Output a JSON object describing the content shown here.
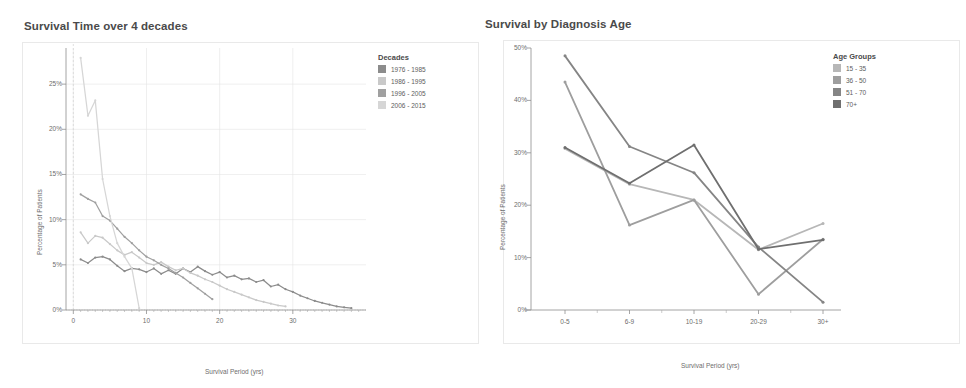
{
  "page": {
    "background": "#ffffff",
    "panel_border_color": "#e9e9e9"
  },
  "charts": {
    "left": {
      "title": "Survival Time over 4 decades",
      "legend_title": "Decades",
      "xlabel": "Survival Period (yrs)",
      "ylabel": "Percentage of Patients"
    },
    "right": {
      "title": "Survival by Diagnosis Age",
      "legend_title": "Age Groups",
      "xlabel": "Survival Period (yrs)",
      "ylabel": "Percentage of Patients"
    }
  },
  "chart_data": [
    {
      "id": "survival-time-over-4-decades",
      "type": "line",
      "title": "Survival Time over 4 decades",
      "xlabel": "Survival Period (yrs)",
      "ylabel": "Percentage of Patients",
      "legend_title": "Decades",
      "legend_position": "right",
      "grid": true,
      "xlim": [
        -1,
        40
      ],
      "ylim": [
        0,
        29
      ],
      "xticks": [
        0,
        10,
        20,
        30
      ],
      "xtick_labels": [
        "0",
        "10",
        "20",
        "30"
      ],
      "yticks": [
        0,
        5,
        10,
        15,
        20,
        25
      ],
      "ytick_labels": [
        "0%",
        "5%",
        "10%",
        "15%",
        "20%",
        "25%"
      ],
      "series": [
        {
          "name": "1976 - 1985",
          "color": "#8c8c8c",
          "x": [
            1,
            2,
            3,
            4,
            5,
            6,
            7,
            8,
            9,
            10,
            11,
            12,
            13,
            14,
            15,
            16,
            17,
            18,
            19,
            20,
            21,
            22,
            23,
            24,
            25,
            26,
            27,
            28,
            29,
            30,
            31,
            32,
            33,
            34,
            35,
            36,
            37,
            38
          ],
          "values": [
            5.6,
            5.2,
            5.8,
            5.9,
            5.6,
            4.9,
            4.3,
            4.6,
            4.5,
            4.2,
            4.6,
            4.0,
            4.4,
            4.0,
            4.6,
            4.2,
            4.8,
            4.3,
            3.9,
            4.2,
            3.6,
            3.8,
            3.4,
            3.5,
            3.1,
            3.3,
            2.6,
            2.8,
            2.3,
            2.0,
            1.6,
            1.3,
            1.0,
            0.8,
            0.6,
            0.4,
            0.3,
            0.2
          ]
        },
        {
          "name": "1986 - 1995",
          "color": "#c9c9c9",
          "x": [
            1,
            2,
            3,
            4,
            5,
            6,
            7,
            8,
            9,
            10,
            11,
            12,
            13,
            14,
            15,
            16,
            17,
            18,
            19,
            20,
            21,
            22,
            23,
            24,
            25,
            26,
            27,
            28,
            29
          ],
          "values": [
            8.6,
            7.4,
            8.2,
            8.0,
            7.3,
            6.6,
            6.1,
            6.4,
            5.8,
            5.2,
            5.0,
            5.3,
            4.8,
            4.4,
            4.6,
            4.1,
            3.8,
            3.4,
            3.1,
            2.7,
            2.3,
            2.0,
            1.7,
            1.4,
            1.1,
            0.9,
            0.7,
            0.5,
            0.4
          ]
        },
        {
          "name": "1996 - 2005",
          "color": "#a0a0a0",
          "x": [
            1,
            2,
            3,
            4,
            5,
            6,
            7,
            8,
            9,
            10,
            11,
            12,
            13,
            14,
            15,
            16,
            17,
            18,
            19
          ],
          "values": [
            12.8,
            12.3,
            11.9,
            10.4,
            9.9,
            9.0,
            8.1,
            7.4,
            6.6,
            5.9,
            5.5,
            5.0,
            4.6,
            4.1,
            3.6,
            3.0,
            2.4,
            1.8,
            1.2
          ]
        },
        {
          "name": "2006 - 2015",
          "color": "#d6d6d6",
          "x": [
            1,
            2,
            3,
            4,
            5,
            6,
            7,
            8,
            9
          ],
          "values": [
            27.9,
            21.5,
            23.2,
            14.5,
            10.4,
            7.4,
            5.9,
            4.6,
            0.2
          ]
        }
      ]
    },
    {
      "id": "survival-by-diagnosis-age",
      "type": "line",
      "title": "Survival by Diagnosis Age",
      "xlabel": "Survival Period (yrs)",
      "ylabel": "Percentage of Patients",
      "legend_title": "Age Groups",
      "legend_position": "right",
      "grid": false,
      "categories": [
        "0-5",
        "6-9",
        "10-19",
        "20-29",
        "30+"
      ],
      "ylim": [
        0,
        50
      ],
      "yticks": [
        0,
        10,
        20,
        30,
        40,
        50
      ],
      "ytick_labels": [
        "0%",
        "10%",
        "20%",
        "30%",
        "40%",
        "50%"
      ],
      "series": [
        {
          "name": "15 - 35",
          "color": "#b7b7b7",
          "values": [
            30.8,
            24.0,
            21.0,
            11.5,
            16.5
          ]
        },
        {
          "name": "36 - 50",
          "color": "#9e9e9e",
          "values": [
            43.5,
            16.2,
            21.0,
            3.0,
            13.5
          ]
        },
        {
          "name": "51 - 70",
          "color": "#858585",
          "values": [
            48.5,
            31.2,
            26.2,
            12.0,
            1.5
          ]
        },
        {
          "name": "70+",
          "color": "#6f6f6f",
          "values": [
            31.0,
            24.2,
            31.5,
            11.6,
            13.4
          ]
        }
      ]
    }
  ]
}
